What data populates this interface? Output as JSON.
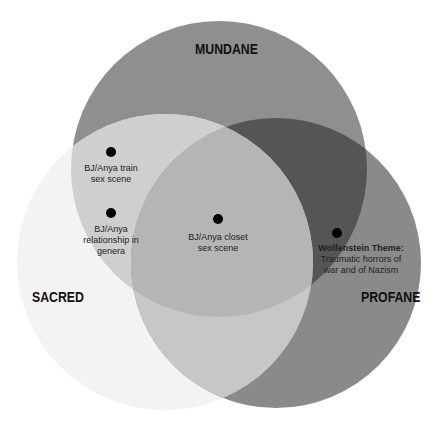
{
  "diagram": {
    "type": "venn",
    "circles": [
      {
        "id": "mundane",
        "label": "MUNDANE",
        "color": "#8f8f8f",
        "cx": 219,
        "cy": 169,
        "r": 148
      },
      {
        "id": "sacred",
        "label": "SACRED",
        "color": "#f3f3f3",
        "cx": 165,
        "cy": 262,
        "r": 148
      },
      {
        "id": "profane",
        "label": "PROFANE",
        "color": "#8a8a8a",
        "cx": 276,
        "cy": 263,
        "r": 145
      }
    ],
    "region_colors": {
      "mundane_sacred": "#cfcfcf",
      "mundane_profane": "#555555",
      "sacred_profane": "#c7c7c7",
      "all_three": "#b5b5b5"
    },
    "items": [
      {
        "label_line1": "BJ/Anya train",
        "label_line2": "sex scene",
        "region": "mundane_sacred"
      },
      {
        "label_line1": "BJ/Anya",
        "label_line2": "relationship in",
        "label_line3": "genera",
        "region": "mundane_sacred"
      },
      {
        "label_line1": "BJ/Anya closet",
        "label_line2": "sex scene",
        "region": "all_three"
      },
      {
        "title": "Wolfenstein Theme:",
        "label_line1": "Traumatic horrors of",
        "label_line2": "war and of Nazism",
        "region": "mundane_profane"
      }
    ]
  }
}
